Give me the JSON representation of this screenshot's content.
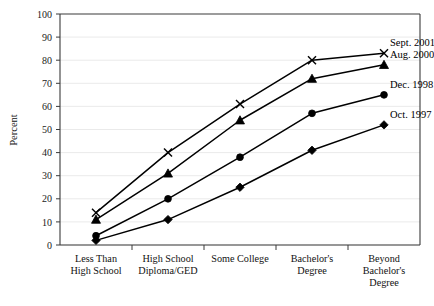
{
  "chart_data": {
    "type": "line",
    "title": "",
    "xlabel": "",
    "ylabel": "Percent",
    "ylim": [
      0,
      100
    ],
    "yticks": [
      0,
      10,
      20,
      30,
      40,
      50,
      60,
      70,
      80,
      90,
      100
    ],
    "ytick_labels": [
      "0",
      "10",
      "20",
      "30",
      "40",
      "50",
      "60",
      "70",
      "80",
      "90",
      "100"
    ],
    "grid": true,
    "legend_position": "right-inline-end-of-line",
    "categories": [
      "Less Than High School",
      "High School Diploma/GED",
      "Some College",
      "Bachelor's Degree",
      "Beyond Bachelor's Degree"
    ],
    "category_lines": [
      [
        "Less Than",
        "High School"
      ],
      [
        "High School",
        "Diploma/GED"
      ],
      [
        "Some College"
      ],
      [
        "Bachelor's",
        "Degree"
      ],
      [
        "Beyond",
        "Bachelor's",
        "Degree"
      ]
    ],
    "series": [
      {
        "name": "Sept. 2001",
        "marker": "x-cross",
        "values": [
          14,
          40,
          61,
          80,
          83
        ]
      },
      {
        "name": "Aug. 2000",
        "marker": "triangle-up-filled",
        "values": [
          11,
          31,
          54,
          72,
          78
        ]
      },
      {
        "name": "Dec. 1998",
        "marker": "circle-filled",
        "values": [
          4,
          20,
          38,
          57,
          65
        ]
      },
      {
        "name": "Oct. 1997",
        "marker": "diamond-filled",
        "values": [
          2,
          11,
          25,
          41,
          52
        ]
      }
    ],
    "colors": {
      "series_stroke": "#000000",
      "axis": "#3a3a3a",
      "grid": "#e8e8e8",
      "text": "#111111",
      "background": "#ffffff"
    }
  },
  "layout": {
    "plot_left": 60,
    "plot_right": 420,
    "plot_top": 14,
    "plot_bottom": 245,
    "label_offset_x": 6,
    "label_offset_y": -7
  }
}
